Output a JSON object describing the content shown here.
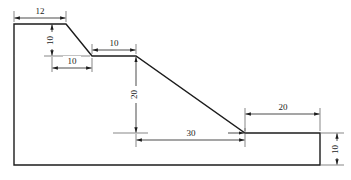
{
  "drawing": {
    "title": "Dimensioned stepped slope profile",
    "units": "unitless",
    "colors": {
      "background": "#ffffff",
      "outline": "#1c1c1c",
      "dimension_line": "#2a2a2a",
      "extension_line": "#555555",
      "text": "#1a1a1a"
    },
    "dimensions": [
      {
        "id": "top-width",
        "label": "12",
        "orientation": "horizontal",
        "position": "top-left"
      },
      {
        "id": "first-drop",
        "label": "10",
        "orientation": "vertical",
        "position": "upper-left"
      },
      {
        "id": "first-run",
        "label": "10",
        "orientation": "horizontal",
        "position": "upper-left"
      },
      {
        "id": "bench-width",
        "label": "10",
        "orientation": "horizontal",
        "position": "upper-middle"
      },
      {
        "id": "main-drop",
        "label": "20",
        "orientation": "vertical",
        "position": "middle"
      },
      {
        "id": "main-run",
        "label": "30",
        "orientation": "horizontal",
        "position": "lower-middle"
      },
      {
        "id": "toe-width",
        "label": "20",
        "orientation": "horizontal",
        "position": "right"
      },
      {
        "id": "toe-height",
        "label": "10",
        "orientation": "vertical",
        "position": "far-right"
      }
    ],
    "profile_vertices": [
      {
        "x": 14,
        "y": 165
      },
      {
        "x": 14,
        "y": 24
      },
      {
        "x": 66,
        "y": 24
      },
      {
        "x": 92,
        "y": 56
      },
      {
        "x": 136,
        "y": 56
      },
      {
        "x": 245,
        "y": 133
      },
      {
        "x": 320,
        "y": 133
      },
      {
        "x": 320,
        "y": 165
      },
      {
        "x": 14,
        "y": 165
      }
    ]
  }
}
